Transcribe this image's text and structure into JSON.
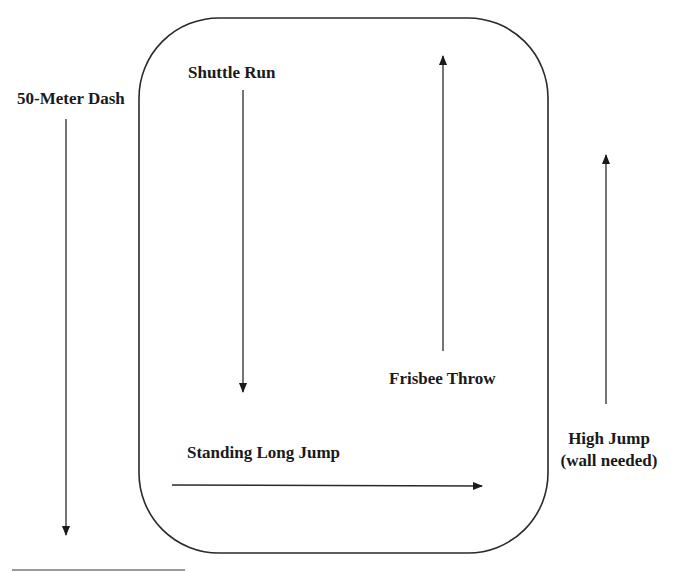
{
  "page": {
    "cropped_header_text": ""
  },
  "diagram": {
    "type": "field layout",
    "colors": {
      "stroke": "#2a2a2a",
      "text": "#1a1a1a",
      "footer_rule": "#9a9a9a"
    },
    "boundary": {
      "name": "Field boundary (rounded rectangle)"
    },
    "stations": [
      {
        "id": "dash",
        "label": "50-Meter Dash",
        "direction": "down"
      },
      {
        "id": "shuttle",
        "label": "Shuttle Run",
        "direction": "down"
      },
      {
        "id": "frisbee",
        "label": "Frisbee Throw",
        "direction": "up"
      },
      {
        "id": "longjump",
        "label": "Standing Long Jump",
        "direction": "right"
      },
      {
        "id": "highjump",
        "label": "High Jump",
        "sublabel": "(wall needed)",
        "direction": "up"
      }
    ]
  }
}
